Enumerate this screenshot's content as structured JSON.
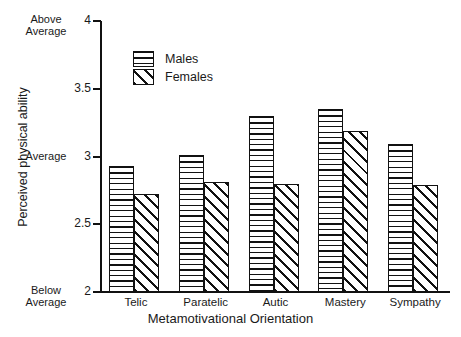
{
  "chart_data": {
    "type": "bar",
    "title": "",
    "xlabel": "Metamotivational Orientation",
    "ylabel": "Perceived physical ability",
    "categories": [
      "Telic",
      "Paratelic",
      "Autic",
      "Mastery",
      "Sympathy"
    ],
    "series": [
      {
        "name": "Males",
        "values": [
          2.93,
          3.01,
          3.3,
          3.35,
          3.09
        ]
      },
      {
        "name": "Females",
        "values": [
          2.72,
          2.81,
          2.8,
          3.19,
          2.79
        ]
      }
    ],
    "ylim": [
      2,
      4
    ],
    "yticks": [
      2,
      2.5,
      3,
      3.5,
      4
    ],
    "ytick_labels": [
      "2",
      "2.5",
      "3",
      "3.5",
      "4"
    ],
    "ytick_annotations": {
      "4": [
        "Above",
        "Average"
      ],
      "3": [
        "Average"
      ],
      "2": [
        "Below",
        "Average"
      ]
    },
    "grid": false,
    "legend_position": "upper-left-inside",
    "legend": [
      {
        "label": "Males",
        "pattern": "horizontal-hatch"
      },
      {
        "label": "Females",
        "pattern": "diagonal-hatch"
      }
    ]
  }
}
